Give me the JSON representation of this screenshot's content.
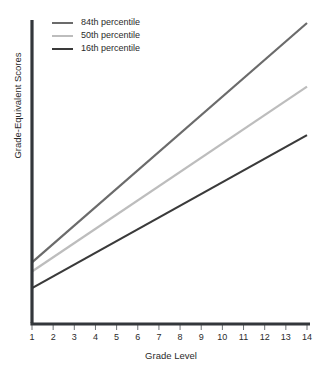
{
  "chart_data": {
    "type": "line",
    "title": "",
    "subtitle": "",
    "xlabel": "Grade Level",
    "ylabel": "Grade-Equivalent Scores",
    "xlim": [
      1,
      14
    ],
    "ylim": [
      0,
      10
    ],
    "grid": false,
    "background": "#ffffff",
    "legend_position": "top-left",
    "x": [
      1,
      14
    ],
    "xticks": [
      "1",
      "2",
      "3",
      "4",
      "5",
      "6",
      "7",
      "8",
      "9",
      "10",
      "11",
      "12",
      "13",
      "14"
    ],
    "yticks": [],
    "series": [
      {
        "name": "84th percentile",
        "color": "#6b6b6b",
        "values": [
          2.0,
          9.9
        ]
      },
      {
        "name": "50th percentile",
        "color": "#bdbdbd",
        "values": [
          1.7,
          7.8
        ]
      },
      {
        "name": "16th percentile",
        "color": "#3a3a3a",
        "values": [
          1.15,
          6.2
        ]
      }
    ]
  },
  "axes": {
    "line_color": "#33373b",
    "tick_color": "#6e7277"
  },
  "legend": {
    "entries": [
      {
        "label": "84th percentile",
        "color": "#6b6b6b"
      },
      {
        "label": "50th percentile",
        "color": "#bdbdbd"
      },
      {
        "label": "16th percentile",
        "color": "#3a3a3a"
      }
    ]
  }
}
